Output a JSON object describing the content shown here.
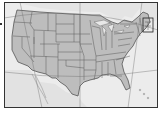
{
  "map": {
    "title": "United States map",
    "colors": {
      "background": "#ffffff",
      "frame": "#3a3a3a",
      "land_us": "#bdbdbd",
      "land_other": "#e6e6e6",
      "water": "#ececec",
      "state_border": "#555555",
      "graticule": "#6a6a6a"
    },
    "inset_highlight": "northeast-inset"
  }
}
